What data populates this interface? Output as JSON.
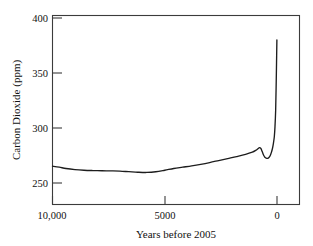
{
  "chart_data": {
    "type": "line",
    "title": "",
    "xlabel": "Years before 2005",
    "ylabel": "Carbon Dioxide (ppm)",
    "xlim": [
      10600,
      -600
    ],
    "ylim": [
      243,
      410
    ],
    "x_ticks": [
      {
        "value": 10000,
        "label": "10,000"
      },
      {
        "value": 5000,
        "label": "5000"
      },
      {
        "value": 0,
        "label": "0"
      }
    ],
    "y_ticks": [
      {
        "value": 250,
        "label": "250"
      },
      {
        "value": 300,
        "label": "300"
      },
      {
        "value": 350,
        "label": "350"
      },
      {
        "value": 400,
        "label": "400"
      }
    ],
    "grid": false,
    "legend": null,
    "series": [
      {
        "name": "Atmospheric CO2",
        "x": [
          10000,
          9700,
          9400,
          9000,
          8600,
          8200,
          7800,
          7400,
          7000,
          6600,
          6200,
          5800,
          5400,
          5000,
          4600,
          4200,
          3800,
          3400,
          3000,
          2600,
          2200,
          1800,
          1400,
          1100,
          950,
          850,
          780,
          720,
          660,
          600,
          540,
          480,
          420,
          360,
          300,
          250,
          200,
          160,
          120,
          90,
          60,
          40,
          20,
          5
        ],
        "y": [
          265.3,
          264.4,
          263.2,
          262.2,
          261.6,
          261.3,
          261.1,
          261.0,
          260.8,
          260.3,
          259.8,
          259.6,
          260.2,
          261.6,
          263.2,
          264.4,
          265.6,
          267.0,
          268.6,
          270.4,
          272.2,
          274.0,
          276.0,
          278.0,
          279.6,
          281.1,
          282.2,
          281.4,
          278.6,
          275.4,
          273.4,
          272.6,
          272.4,
          273.2,
          275.0,
          277.8,
          281.6,
          286.0,
          292.0,
          301.0,
          316.0,
          336.0,
          360.0,
          380.0
        ]
      }
    ]
  },
  "figure": {
    "background_color": "#ffffff",
    "line_color": "#1d1d1d",
    "axis_color": "#3b3b3b"
  }
}
